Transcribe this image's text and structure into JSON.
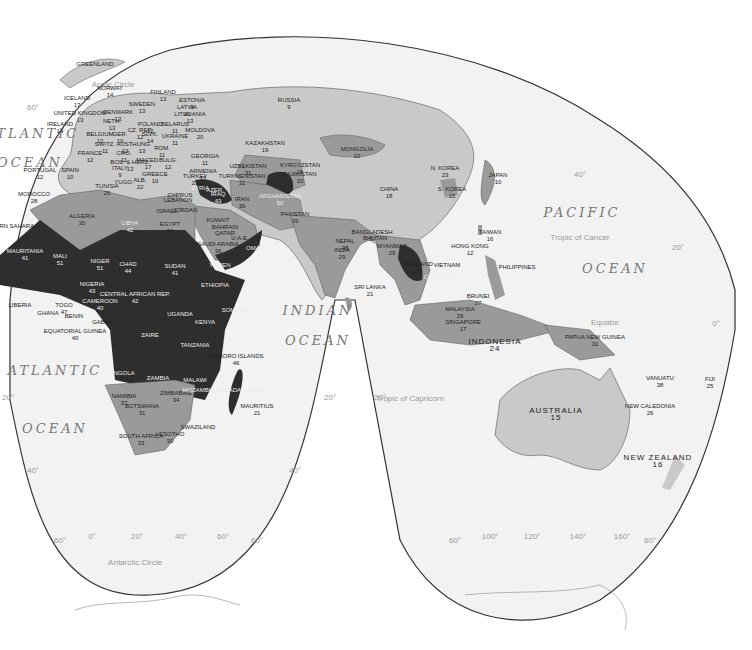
{
  "map": {
    "projection": "interrupted Goode homolosine",
    "colors": {
      "ocean": "#f2f2f2",
      "low": "#c9c9c9",
      "mid": "#9a9a9a",
      "high": "#2e2e2e",
      "border": "#444"
    },
    "oceans": {
      "atlantic_n1": "ATLANTIC",
      "atlantic_n2": "OCEAN",
      "atlantic_s1": "ATLANTIC",
      "atlantic_s2": "OCEAN",
      "indian1": "INDIAN",
      "indian2": "OCEAN",
      "pacific1": "PACIFIC",
      "pacific2": "OCEAN"
    },
    "lines": {
      "arctic": "Arctic Circle",
      "cancer": "Tropic of Cancer",
      "equator": "Equator",
      "capricorn": "Tropic of Capricorn",
      "antarctic": "Antarctic Circle"
    },
    "gridlabels": {
      "l60n": "60°",
      "l40n": "40°",
      "l20n": "20°",
      "l0": "0°",
      "l20s_a": "20°",
      "l20s_b": "20°",
      "l20s_c": "20°",
      "l40s_a": "40°",
      "l40s_b": "40°",
      "b60a": "60°",
      "b0": "0°",
      "b20": "20°",
      "b40": "40°",
      "b60b": "60°",
      "b60c": "60°",
      "b60d": "60°",
      "b100": "100°",
      "b120": "120°",
      "b140": "140°",
      "b160": "160°",
      "b60e": "60°"
    },
    "countries": [
      {
        "name": "GREENLAND",
        "value": ""
      },
      {
        "name": "ICELAND",
        "value": "17"
      },
      {
        "name": "NORWAY",
        "value": "14"
      },
      {
        "name": "SWEDEN",
        "value": "13"
      },
      {
        "name": "FINLAND",
        "value": "13"
      },
      {
        "name": "ESTONIA",
        "value": "9"
      },
      {
        "name": "LATVIA",
        "value": "10"
      },
      {
        "name": "LITHUANIA",
        "value": "13"
      },
      {
        "name": "UNITED KINGDOM",
        "value": "13"
      },
      {
        "name": "IRELAND",
        "value": "14"
      },
      {
        "name": "DENMARK",
        "value": "13"
      },
      {
        "name": "NETH.",
        "value": "13"
      },
      {
        "name": "BELGIUM",
        "value": "12"
      },
      {
        "name": "GER.",
        "value": "10"
      },
      {
        "name": "POLAND",
        "value": "12"
      },
      {
        "name": "BELARUS",
        "value": "11"
      },
      {
        "name": "CZ. REP.",
        "value": "12"
      },
      {
        "name": "SLVK.",
        "value": "14"
      },
      {
        "name": "UKRAINE",
        "value": "11"
      },
      {
        "name": "MOLDOVA",
        "value": "20"
      },
      {
        "name": "FRANCE",
        "value": "12"
      },
      {
        "name": "SWITZ.",
        "value": "11"
      },
      {
        "name": "AUST.",
        "value": "12"
      },
      {
        "name": "HUNG.",
        "value": "13"
      },
      {
        "name": "ROM.",
        "value": "11"
      },
      {
        "name": "CRO.",
        "value": "11"
      },
      {
        "name": "BOS. & HERZ.",
        "value": "13"
      },
      {
        "name": "BULG.",
        "value": "12"
      },
      {
        "name": "ITALY",
        "value": "9"
      },
      {
        "name": "MACED.",
        "value": "17"
      },
      {
        "name": "ALB.",
        "value": "22"
      },
      {
        "name": "GREECE",
        "value": "10"
      },
      {
        "name": "YUGO.",
        "value": ""
      },
      {
        "name": "PORTUGAL",
        "value": "12"
      },
      {
        "name": "SPAIN",
        "value": "10"
      },
      {
        "name": "RUSSIA",
        "value": "9"
      },
      {
        "name": "GEORGIA",
        "value": "11"
      },
      {
        "name": "ARMENIA",
        "value": "15"
      },
      {
        "name": "AZER.",
        "value": ""
      },
      {
        "name": "TURKEY",
        "value": "23"
      },
      {
        "name": "KAZAKHSTAN",
        "value": "19"
      },
      {
        "name": "UZBEKISTAN",
        "value": "31"
      },
      {
        "name": "TURKMENISTAN",
        "value": "31"
      },
      {
        "name": "KYRGYZSTAN",
        "value": "26"
      },
      {
        "name": "TAJIKISTAN",
        "value": "33"
      },
      {
        "name": "MONGOLIA",
        "value": "22"
      },
      {
        "name": "CHINA",
        "value": "18"
      },
      {
        "name": "N. KOREA",
        "value": "23"
      },
      {
        "name": "S. KOREA",
        "value": "15"
      },
      {
        "name": "JAPAN",
        "value": "10"
      },
      {
        "name": "TAIWAN",
        "value": "16"
      },
      {
        "name": "HONG KONG",
        "value": "12"
      },
      {
        "name": "PHILIPPINES",
        "value": ""
      },
      {
        "name": "IRAN",
        "value": "36"
      },
      {
        "name": "AFGHANISTAN",
        "value": "50"
      },
      {
        "name": "PAKISTAN",
        "value": "39"
      },
      {
        "name": "IRAQ",
        "value": "43"
      },
      {
        "name": "SYRIA",
        "value": ""
      },
      {
        "name": "CYPRUS",
        "value": ""
      },
      {
        "name": "LEBANON",
        "value": ""
      },
      {
        "name": "ISRAEL",
        "value": ""
      },
      {
        "name": "JORDAN",
        "value": ""
      },
      {
        "name": "KUWAIT",
        "value": ""
      },
      {
        "name": "BAHRAIN",
        "value": ""
      },
      {
        "name": "QATAR",
        "value": ""
      },
      {
        "name": "U.A.E.",
        "value": ""
      },
      {
        "name": "SAUDI ARABIA",
        "value": "36"
      },
      {
        "name": "OMAN",
        "value": ""
      },
      {
        "name": "YEMEN",
        "value": ""
      },
      {
        "name": "NEPAL",
        "value": "38"
      },
      {
        "name": "BHUTAN",
        "value": ""
      },
      {
        "name": "BANGLADESH",
        "value": "30"
      },
      {
        "name": "INDIA",
        "value": "29"
      },
      {
        "name": "SRI LANKA",
        "value": "21"
      },
      {
        "name": "MYANMAR",
        "value": "29"
      },
      {
        "name": "THAILAND",
        "value": "20"
      },
      {
        "name": "VIETNAM",
        "value": ""
      },
      {
        "name": "CAMBODIA",
        "value": ""
      },
      {
        "name": "BRUNEI",
        "value": "27"
      },
      {
        "name": "MALAYSIA",
        "value": "29"
      },
      {
        "name": "SINGAPORE",
        "value": "17"
      },
      {
        "name": "INDONESIA",
        "value": "24"
      },
      {
        "name": "PAPUA NEW GUINEA",
        "value": "31"
      },
      {
        "name": "AUSTRALIA",
        "value": "15"
      },
      {
        "name": "VANUATU",
        "value": "38"
      },
      {
        "name": "NEW CALEDONIA",
        "value": "26"
      },
      {
        "name": "FIJI",
        "value": "25"
      },
      {
        "name": "NEW ZEALAND",
        "value": "16"
      },
      {
        "name": "MOROCCO",
        "value": "28"
      },
      {
        "name": "WESTERN SAHARA",
        "value": ""
      },
      {
        "name": "ALGERIA",
        "value": "30"
      },
      {
        "name": "TUNISIA",
        "value": "25"
      },
      {
        "name": "LIBYA",
        "value": "42"
      },
      {
        "name": "EGYPT",
        "value": "30"
      },
      {
        "name": "MAURITANIA",
        "value": "41"
      },
      {
        "name": "MALI",
        "value": "51"
      },
      {
        "name": "NIGER",
        "value": "51"
      },
      {
        "name": "CHAD",
        "value": "44"
      },
      {
        "name": "SUDAN",
        "value": "41"
      },
      {
        "name": "LIBERIA",
        "value": ""
      },
      {
        "name": "GHANA",
        "value": ""
      },
      {
        "name": "TOGO",
        "value": "47"
      },
      {
        "name": "BENIN",
        "value": ""
      },
      {
        "name": "NIGERIA",
        "value": "43"
      },
      {
        "name": "CAMEROON",
        "value": "40"
      },
      {
        "name": "CENTRAL AFRICAN REP.",
        "value": "42"
      },
      {
        "name": "EQUATORIAL GUINEA",
        "value": "40"
      },
      {
        "name": "GABON",
        "value": ""
      },
      {
        "name": "ETHIOPIA",
        "value": ""
      },
      {
        "name": "SOMALIA",
        "value": ""
      },
      {
        "name": "UGANDA",
        "value": ""
      },
      {
        "name": "KENYA",
        "value": ""
      },
      {
        "name": "ZAIRE",
        "value": ""
      },
      {
        "name": "TANZANIA",
        "value": ""
      },
      {
        "name": "ANGOLA",
        "value": ""
      },
      {
        "name": "ZAMBIA",
        "value": ""
      },
      {
        "name": "MALAWI",
        "value": ""
      },
      {
        "name": "NAMIBIA",
        "value": "37"
      },
      {
        "name": "BOTSWANA",
        "value": "31"
      },
      {
        "name": "ZIMBABWE",
        "value": "34"
      },
      {
        "name": "MOZAMBIQUE",
        "value": ""
      },
      {
        "name": "MADAGASCAR",
        "value": ""
      },
      {
        "name": "COMORO ISLANDS",
        "value": "46"
      },
      {
        "name": "MAURITIUS",
        "value": "21"
      },
      {
        "name": "SWAZILAND",
        "value": ""
      },
      {
        "name": "LESOTHO",
        "value": "30"
      },
      {
        "name": "SOUTH AFRICA",
        "value": "33"
      }
    ]
  }
}
